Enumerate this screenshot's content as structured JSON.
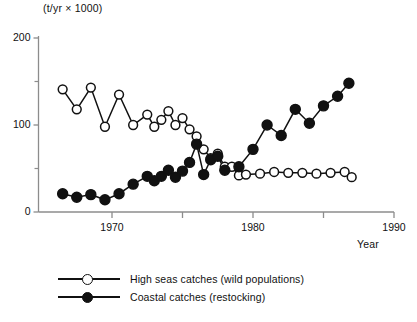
{
  "chart_data": {
    "type": "line",
    "title": "",
    "subtitle": "",
    "unit_label": "(t/yr × 1000)",
    "xlabel": "Year",
    "ylabel": "(t/yr × 1000)",
    "xlim": [
      1966,
      1990
    ],
    "ylim": [
      0,
      200
    ],
    "grid": false,
    "legend_position": "bottom-left",
    "x_ticks": [
      1970,
      1980,
      1990
    ],
    "x_tick_labels": [
      "1970",
      "1980",
      "1990"
    ],
    "x_minor_ticks": [
      1975,
      1985
    ],
    "y_ticks": [
      0,
      100,
      200
    ],
    "y_tick_labels": [
      "0",
      "100",
      "200"
    ],
    "y_minor_ticks": [
      50,
      150
    ],
    "series": [
      {
        "name": "High seas catches (wild populations)",
        "marker": "open-circle",
        "color": "#111111",
        "x": [
          1966.5,
          1967.5,
          1968.5,
          1969.5,
          1970.5,
          1971.5,
          1972.5,
          1973.0,
          1973.5,
          1974.0,
          1974.5,
          1975.0,
          1975.5,
          1976.0,
          1976.5,
          1977.0,
          1977.5,
          1978.0,
          1978.5,
          1979.0,
          1979.5,
          1980.5,
          1981.5,
          1982.5,
          1983.5,
          1984.5,
          1985.5,
          1986.5,
          1987.0
        ],
        "y": [
          141,
          118,
          143,
          98,
          135,
          100,
          112,
          98,
          106,
          116,
          100,
          108,
          95,
          87,
          72,
          62,
          67,
          52,
          52,
          42,
          43,
          44,
          46,
          45,
          45,
          44,
          45,
          46,
          40
        ]
      },
      {
        "name": "Coastal catches (restocking)",
        "marker": "filled-circle",
        "color": "#111111",
        "x": [
          1966.5,
          1967.5,
          1968.5,
          1969.5,
          1970.5,
          1971.5,
          1972.5,
          1973.0,
          1973.5,
          1974.0,
          1974.5,
          1975.0,
          1975.5,
          1976.0,
          1976.5,
          1977.0,
          1977.5,
          1978.0,
          1979.0,
          1980.0,
          1981.0,
          1982.0,
          1983.0,
          1984.0,
          1985.0,
          1986.0,
          1986.8
        ],
        "y": [
          21,
          17,
          20,
          14,
          21,
          32,
          41,
          36,
          41,
          48,
          40,
          47,
          57,
          78,
          43,
          60,
          64,
          48,
          52,
          72,
          100,
          88,
          118,
          102,
          122,
          133,
          148
        ]
      }
    ]
  },
  "legend": {
    "items": [
      {
        "marker": "open-circle",
        "label": "High seas catches (wild populations)"
      },
      {
        "marker": "filled-circle",
        "label": "Coastal catches (restocking)"
      }
    ]
  }
}
